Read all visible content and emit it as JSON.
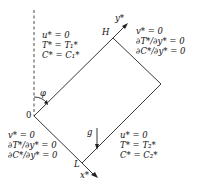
{
  "diagram": {
    "type": "inclined square cavity boundary conditions",
    "labels": {
      "origin": "0",
      "height": "H",
      "length": "L",
      "x_axis": "x*",
      "y_axis": "y*",
      "angle": "φ",
      "gravity": "g"
    },
    "boundaries": {
      "left_wall": [
        "u* = 0",
        "T* = T₁*",
        "C* = C₁*"
      ],
      "top_wall": [
        "v* = 0",
        "∂T*/∂y* = 0",
        "∂C*/∂y* = 0"
      ],
      "bottom_wall": [
        "v* = 0",
        "∂T*/∂y* = 0",
        "∂C*/∂y* = 0"
      ],
      "right_wall": [
        "u* = 0",
        "T* = T₂*",
        "C* = C₂*"
      ]
    },
    "colors": {
      "line": "#222222"
    }
  }
}
